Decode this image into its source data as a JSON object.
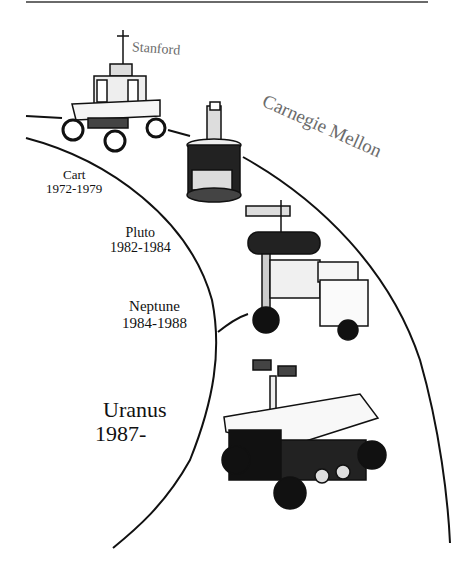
{
  "figure": {
    "organizations": {
      "stanford": "Stanford",
      "cmu": "Carnegie Mellon"
    },
    "robots": [
      {
        "name": "Cart",
        "years": "1972-1979"
      },
      {
        "name": "Pluto",
        "years": "1982-1984"
      },
      {
        "name": "Neptune",
        "years": "1984-1988"
      },
      {
        "name": "Uranus",
        "years": "1987-"
      }
    ],
    "colors": {
      "line": "#111111",
      "org_text": "#6b6b6b",
      "top_rule": "#6a6a6a"
    }
  }
}
